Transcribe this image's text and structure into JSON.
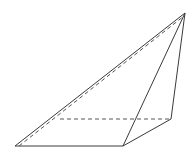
{
  "diagram": {
    "type": "pyramid",
    "stroke_color": "#3a3a3a",
    "dash_color": "#555555",
    "background": "#ffffff",
    "vertices": {
      "apex": [
        185,
        13
      ],
      "base_front_left": [
        15,
        146
      ],
      "base_front_right": [
        123,
        146
      ],
      "base_back_right": [
        171,
        119
      ],
      "base_back_left": [
        60,
        119
      ]
    },
    "solid_edges": [
      [
        "base_front_left",
        "apex"
      ],
      [
        "base_front_left",
        "base_front_right"
      ],
      [
        "base_front_right",
        "apex"
      ],
      [
        "base_front_right",
        "base_back_right"
      ],
      [
        "base_back_right",
        "apex"
      ]
    ],
    "hidden_edges": [
      [
        "base_back_left",
        "base_back_right"
      ],
      [
        "base_front_left",
        "apex"
      ]
    ]
  }
}
